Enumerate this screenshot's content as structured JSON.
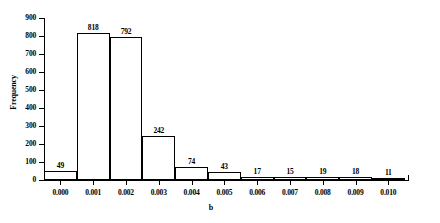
{
  "chart_data": {
    "type": "bar",
    "title": "",
    "subtitle": "",
    "xlabel": "b",
    "ylabel": "Frequency",
    "categories": [
      "0.000",
      "0.001",
      "0.002",
      "0.003",
      "0.004",
      "0.005",
      "0.006",
      "0.007",
      "0.008",
      "0.009",
      "0.010"
    ],
    "values": [
      49,
      818,
      792,
      242,
      74,
      43,
      17,
      15,
      19,
      18,
      11
    ],
    "bar_labels": [
      "49",
      "818",
      "792",
      "242",
      "74",
      "43",
      "17",
      "15",
      "19",
      "18",
      "11"
    ],
    "xtick_labels": [
      "0.000",
      "0.001",
      "0.002",
      "0.003",
      "0.004",
      "0.005",
      "0.006",
      "0.007",
      "0.008",
      "0.009",
      "0.010"
    ],
    "ytick_labels": [
      "0",
      "100",
      "200",
      "300",
      "400",
      "500",
      "600",
      "700",
      "800",
      "900"
    ],
    "ytick_values": [
      0,
      100,
      200,
      300,
      400,
      500,
      600,
      700,
      800,
      900
    ],
    "ylim": [
      0,
      900
    ],
    "xlim": [
      -0.0005,
      0.0105
    ],
    "bin_width": 0.001,
    "grid": false,
    "legend": null,
    "bar_color": "#ffffff",
    "bar_edge_color": "#000000",
    "axis_color": "#000000"
  },
  "figure": {
    "background": "#ffffff",
    "text_color": "#000000"
  }
}
